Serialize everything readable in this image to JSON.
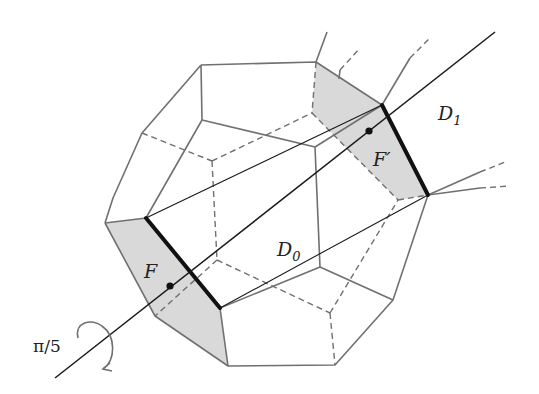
{
  "figure": {
    "colors": {
      "edge": "#707070",
      "axis": "#1a1a1a",
      "highlight_edge": "#111111",
      "face_fill": "#d9d9d9",
      "background": "#ffffff"
    }
  },
  "labels": {
    "D1": {
      "main": "D",
      "sub": "1"
    },
    "D0": {
      "main": "D",
      "sub": "0"
    },
    "F": {
      "main": "F"
    },
    "Fprime": {
      "main": "F",
      "prime": "′"
    },
    "rotation": {
      "text": "π/5"
    }
  },
  "geometry": {
    "axis": {
      "x1": 55,
      "y1": 378,
      "x2": 495,
      "y2": 32
    },
    "point_F": {
      "x": 170,
      "y": 286
    },
    "point_Fprime": {
      "x": 369,
      "y": 131
    }
  }
}
